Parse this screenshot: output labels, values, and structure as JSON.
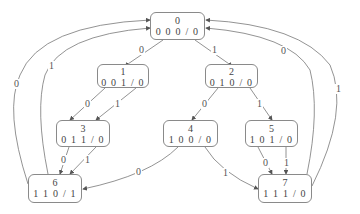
{
  "diagram": {
    "type": "state-transition-diagram",
    "nodes": [
      {
        "id": "0",
        "label": "0",
        "code": "0 0 0 / 0",
        "x": 150,
        "y": 12,
        "w": 55,
        "h": 28
      },
      {
        "id": "1",
        "label": "1",
        "code": "0 0 1 / 0",
        "x": 97,
        "y": 66,
        "w": 52,
        "h": 22
      },
      {
        "id": "2",
        "label": "2",
        "code": "0 1 0 / 0",
        "x": 205,
        "y": 66,
        "w": 53,
        "h": 22
      },
      {
        "id": "3",
        "label": "3",
        "code": "0 1 1 / 0",
        "x": 56,
        "y": 120,
        "w": 54,
        "h": 27
      },
      {
        "id": "4",
        "label": "4",
        "code": "1 0 0 / 0",
        "x": 163,
        "y": 120,
        "w": 55,
        "h": 27
      },
      {
        "id": "5",
        "label": "5",
        "code": "1 0 1 / 0",
        "x": 245,
        "y": 120,
        "w": 53,
        "h": 27
      },
      {
        "id": "6",
        "label": "6",
        "code": "1 1 0 / 1",
        "x": 28,
        "y": 174,
        "w": 54,
        "h": 29
      },
      {
        "id": "7",
        "label": "7",
        "code": "1 1 1 / 0",
        "x": 258,
        "y": 174,
        "w": 54,
        "h": 29
      }
    ],
    "edges": [
      {
        "from": "0",
        "to": "1",
        "label": "0",
        "lx": 140,
        "ly": 49
      },
      {
        "from": "0",
        "to": "2",
        "label": "1",
        "lx": 213,
        "ly": 49
      },
      {
        "from": "1",
        "to": "3",
        "label": "0",
        "lx": 85,
        "ly": 102
      },
      {
        "from": "1",
        "to": "3",
        "label": "1",
        "lx": 115,
        "ly": 102
      },
      {
        "from": "2",
        "to": "4",
        "label": "0",
        "lx": 202,
        "ly": 102
      },
      {
        "from": "2",
        "to": "5",
        "label": "1",
        "lx": 257,
        "ly": 102
      },
      {
        "from": "3",
        "to": "6",
        "label": "0",
        "lx": 61,
        "ly": 155
      },
      {
        "from": "3",
        "to": "6",
        "label": "1",
        "lx": 84,
        "ly": 155
      },
      {
        "from": "4",
        "to": "6",
        "label": "0",
        "lx": 135,
        "ly": 167
      },
      {
        "from": "4",
        "to": "7",
        "label": "1",
        "lx": 223,
        "ly": 168
      },
      {
        "from": "5",
        "to": "7",
        "label": "0",
        "lx": 263,
        "ly": 158
      },
      {
        "from": "5",
        "to": "7",
        "label": "1",
        "lx": 283,
        "ly": 158
      },
      {
        "from": "6",
        "to": "0",
        "label": "0",
        "lx": 14,
        "ly": 82
      },
      {
        "from": "6",
        "to": "0",
        "label": "1",
        "lx": 48,
        "ly": 63
      },
      {
        "from": "7",
        "to": "0",
        "label": "0",
        "lx": 280,
        "ly": 47
      },
      {
        "from": "7",
        "to": "0",
        "label": "1",
        "lx": 336,
        "ly": 85
      }
    ]
  }
}
